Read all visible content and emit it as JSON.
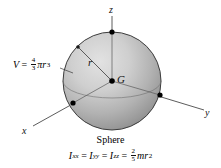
{
  "figure": {
    "caption": "Sphere",
    "center_label": "G",
    "radius_label": "r",
    "axes": [
      {
        "name": "z",
        "label": "z"
      },
      {
        "name": "y",
        "label": "y"
      },
      {
        "name": "x",
        "label": "x"
      }
    ],
    "volume_formula": {
      "symbol": "V",
      "equals": "=",
      "fraction_numerator": "4",
      "fraction_denominator": "3",
      "pi": "π",
      "variable": "r",
      "exponent": "3"
    },
    "inertia_formula": {
      "i1": "I",
      "i1_sub": "xx",
      "eq1": "=",
      "i2": "I",
      "i2_sub": "yy",
      "eq2": "=",
      "i3": "I",
      "i3_sub": "zz",
      "eq3": "=",
      "fraction_numerator": "2",
      "fraction_denominator": "5",
      "mass": "m",
      "variable": "r",
      "exponent": "2"
    },
    "colors": {
      "sphere_light": "#d8d8d8",
      "sphere_mid": "#b4b4b4",
      "sphere_dark": "#8f8f8f",
      "outline": "#3a3a3a",
      "axis_line": "#4a4a4a",
      "dot": "#000000",
      "background": "#ffffff"
    }
  }
}
